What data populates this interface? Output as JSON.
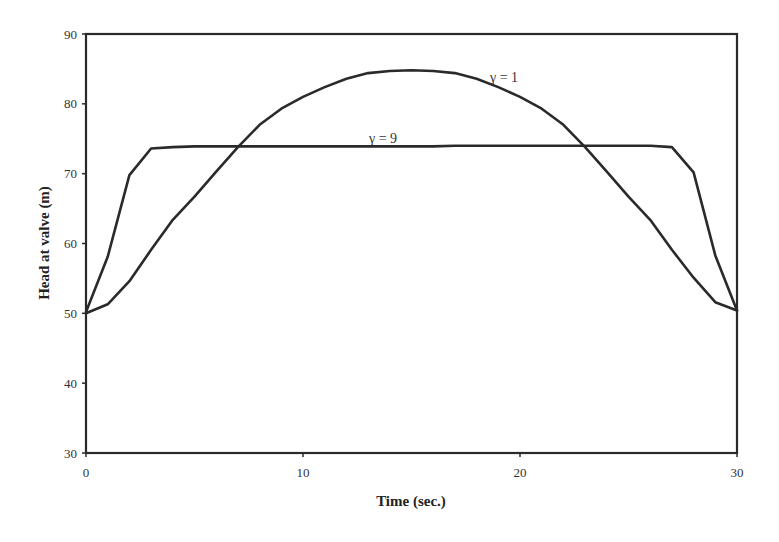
{
  "chart_data": {
    "type": "line",
    "title": "",
    "xlabel": "Time (sec.)",
    "ylabel": "Head at valve (m)",
    "xlim": [
      0,
      30
    ],
    "ylim": [
      30,
      90
    ],
    "xticks": [
      0,
      10,
      20,
      30
    ],
    "yticks": [
      30,
      40,
      50,
      60,
      70,
      80,
      90
    ],
    "grid": false,
    "legend": "none (inline labels)",
    "x": [
      0,
      1,
      2,
      3,
      4,
      5,
      6,
      7,
      8,
      9,
      10,
      11,
      12,
      13,
      14,
      15,
      16,
      17,
      18,
      19,
      20,
      21,
      22,
      23,
      24,
      25,
      26,
      27,
      28,
      29,
      30
    ],
    "series": [
      {
        "name": "γ = 1",
        "label_position": {
          "t": 19.5,
          "head": 82.5
        },
        "values": [
          50.0,
          51.3,
          54.6,
          59.1,
          63.4,
          66.7,
          70.3,
          73.8,
          77.0,
          79.3,
          81.0,
          82.4,
          83.6,
          84.4,
          84.7,
          84.8,
          84.7,
          84.4,
          83.6,
          82.4,
          81.0,
          79.3,
          77.0,
          73.8,
          70.3,
          66.7,
          63.4,
          59.1,
          55.1,
          51.6,
          50.4
        ]
      },
      {
        "name": "γ = 9",
        "label_position": {
          "t": 13.0,
          "head": 74.8
        },
        "values": [
          50.2,
          58.1,
          69.8,
          73.6,
          73.8,
          73.9,
          73.9,
          73.9,
          73.9,
          73.9,
          73.9,
          73.9,
          73.9,
          73.9,
          73.9,
          73.9,
          73.9,
          74.0,
          74.0,
          74.0,
          74.0,
          74.0,
          74.0,
          74.0,
          74.0,
          74.0,
          74.0,
          73.8,
          70.2,
          58.3,
          50.4
        ]
      }
    ]
  },
  "labels": {
    "xaxis_title": "Time (sec.)",
    "yaxis_title": "Head at valve (m)",
    "series1": "γ = 1",
    "series2": "γ = 9"
  }
}
